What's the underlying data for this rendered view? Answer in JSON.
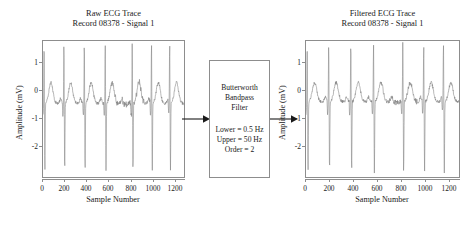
{
  "figure": {
    "background": "#ffffff",
    "line_color": "#7d7d7d",
    "frame_color": "#8d8d8d",
    "text_color": "#1a1a1a"
  },
  "left_panel": {
    "title": "Raw ECG Trace",
    "subtitle": "Record 08378 - Signal 1",
    "xlabel": "Sample Number",
    "ylabel": "Amplitude (mV)",
    "yticks": [
      "1",
      "0",
      "-1",
      "-2"
    ],
    "xticks": [
      "0",
      "200",
      "400",
      "600",
      "800",
      "1000",
      "1200"
    ]
  },
  "right_panel": {
    "title": "Filtered ECG Trace",
    "subtitle": "Record 08378 - Signal 1",
    "xlabel": "Sample Number",
    "ylabel": "Amplitude (mV)",
    "yticks": [
      "1",
      "0",
      "-1",
      "-2"
    ],
    "xticks": [
      "0",
      "200",
      "400",
      "600",
      "800",
      "1000",
      "1200"
    ]
  },
  "filter_block": {
    "name_line1": "Butterworth",
    "name_line2": "Bandpass",
    "name_line3": "Filter",
    "param_lower": "Lower = 0.5 Hz",
    "param_upper": "Upper = 50 Hz",
    "param_order": "Order = 2"
  },
  "chart_data": {
    "type": "line",
    "xlabel": "Sample Number",
    "ylabel": "Amplitude (mV)",
    "xlim": [
      0,
      1280
    ],
    "ylim": [
      -2.6,
      1.75
    ],
    "xticks": [
      0,
      200,
      400,
      600,
      800,
      1000,
      1200
    ],
    "yticks": [
      1,
      0,
      -1,
      -2
    ],
    "grid": false,
    "legend": null,
    "series": [
      {
        "name": "Raw ECG Trace",
        "panel": "left",
        "r_peak_samples": [
          10,
          190,
          375,
          565,
          810,
          985,
          1150
        ],
        "r_peak_amplitude": 1.7,
        "s_trough_amplitude": -2.45,
        "baseline": -0.25,
        "t_wave_amplitude": 0.45
      },
      {
        "name": "Filtered ECG Trace",
        "panel": "right",
        "r_peak_samples": [
          10,
          190,
          375,
          565,
          810,
          985,
          1150
        ],
        "r_peak_amplitude": 1.7,
        "s_trough_amplitude": -2.45,
        "baseline": -0.2,
        "t_wave_amplitude": 0.45
      }
    ],
    "annotation": {
      "block_label": "Butterworth Bandpass Filter",
      "lower_cutoff_hz": 0.5,
      "upper_cutoff_hz": 50,
      "order": 2
    }
  }
}
